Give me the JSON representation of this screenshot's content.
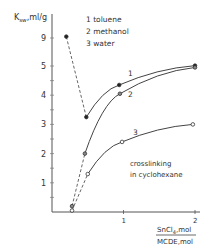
{
  "chart_data": {
    "type": "line",
    "title": "",
    "ylabel": "K_sw, ml/g",
    "xlabel_numerator": "SnCl4, mol",
    "xlabel_denominator": "MCDE, mol",
    "xlabel": "SnCl4, mol / MCDE, mol",
    "x_ticks": [
      1,
      2
    ],
    "y_ticks": [
      1,
      2,
      3,
      4,
      5,
      9
    ],
    "y_axis_break": "axis broken between 5 and 9",
    "xlim": [
      0,
      2.1
    ],
    "ylim": [
      0,
      9.5
    ],
    "grid": false,
    "legend_position": "top-right (numbered list)",
    "annotation": "crosslinking in cyclohexane",
    "series": [
      {
        "name": "toluene",
        "label": "1",
        "marker": "filled-circle",
        "x": [
          0.2,
          0.48,
          0.94,
          2.0
        ],
        "y": [
          9.2,
          3.25,
          4.35,
          5.05
        ],
        "dashed_segment": [
          0,
          1
        ]
      },
      {
        "name": "methanol",
        "label": "2",
        "marker": "half-filled-circle",
        "x": [
          0.28,
          0.46,
          0.95,
          2.0
        ],
        "y": [
          0.2,
          2.0,
          4.05,
          4.95
        ],
        "dashed_segment": [
          0,
          1
        ]
      },
      {
        "name": "water",
        "label": "3",
        "marker": "open-circle",
        "x": [
          0.28,
          0.5,
          0.98,
          1.97
        ],
        "y": [
          0.05,
          1.3,
          2.4,
          3.0
        ],
        "dashed_segment": [
          0,
          1
        ]
      }
    ]
  },
  "legend": {
    "items": [
      "1  toluene",
      "2  methanol",
      "3  water"
    ]
  },
  "axes": {
    "y_title": "K",
    "y_title_sub": "sw",
    "y_title_unit": ",ml/g",
    "x_num": "SnCl",
    "x_num_sub": "4",
    "x_num_unit": ",mol",
    "x_den": "MCDE,mol"
  },
  "annotation": {
    "line1": "crosslinking",
    "line2": "in cyclohexane"
  },
  "series_labels": [
    "1",
    "2",
    "3"
  ]
}
